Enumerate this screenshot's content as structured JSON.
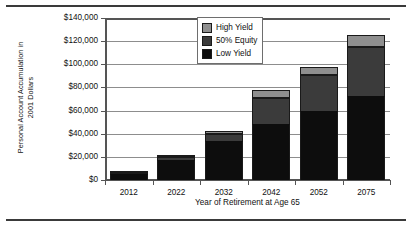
{
  "chart_data": {
    "type": "bar",
    "subtype": "stacked-bar",
    "title": "",
    "xlabel": "Year of Retirement at Age 65",
    "ylabel": "Personal Account Accumulation in 2001 Dollars",
    "ylabel_line1": "Personal Account Accumulation in",
    "ylabel_line2": "2001 Dollars",
    "categories": [
      "2012",
      "2022",
      "2032",
      "2042",
      "2052",
      "2075"
    ],
    "series": [
      {
        "name": "Low Yield",
        "color": "#0d0d0d",
        "values": [
          5000,
          17000,
          34000,
          48000,
          60000,
          73000
        ]
      },
      {
        "name": "50% Equity",
        "color": "#3b3b3b",
        "values": [
          1000,
          2500,
          6000,
          23000,
          31000,
          42000
        ]
      },
      {
        "name": "High Yield",
        "color": "#8f8f8f",
        "values": [
          1000,
          1000,
          2000,
          7000,
          7000,
          10000
        ]
      }
    ],
    "totals": [
      7000,
      20500,
      42000,
      78000,
      98000,
      125000
    ],
    "ylim": [
      0,
      140000
    ],
    "ytick_values": [
      140000,
      120000,
      100000,
      80000,
      60000,
      40000,
      20000,
      0
    ],
    "ytick_labels": [
      "$140,000",
      "$120,000",
      "$100,000",
      "$80,000",
      "$60,000",
      "$40,000",
      "$20,000",
      "$0"
    ],
    "grid": true,
    "grid_axis": "y",
    "legend_position": "top-center",
    "legend_order": [
      "High Yield",
      "50% Equity",
      "Low Yield"
    ]
  },
  "legend": {
    "items": [
      {
        "label": "High Yield",
        "color": "#8f8f8f"
      },
      {
        "label": "50% Equity",
        "color": "#3b3b3b"
      },
      {
        "label": "Low Yield",
        "color": "#0d0d0d"
      }
    ]
  }
}
